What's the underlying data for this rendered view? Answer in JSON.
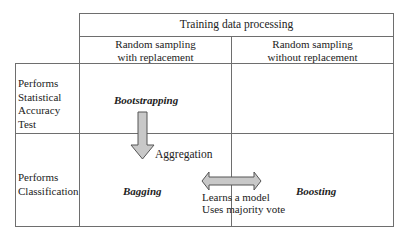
{
  "diagram": {
    "header": {
      "title": "Training data processing",
      "columns": [
        {
          "label_line1": "Random sampling",
          "label_line2": "with replacement"
        },
        {
          "label_line1": "Random sampling",
          "label_line2": "without replacement"
        }
      ]
    },
    "rows": [
      {
        "label_lines": [
          "Performs",
          "Statistical",
          "Accuracy",
          "Test"
        ]
      },
      {
        "label_lines": [
          "Performs",
          "Classification"
        ]
      }
    ],
    "cells": {
      "bootstrapping": "Bootstrapping",
      "bagging": "Bagging",
      "boosting": "Boosting"
    },
    "arrows": {
      "down_arrow": {
        "label": "Aggregation",
        "fill": "#c8c8c8",
        "stroke": "#555555"
      },
      "double_arrow": {
        "label_line1": "Learns a model",
        "label_line2": "Uses majority vote",
        "fill": "#c8c8c8",
        "stroke": "#555555"
      }
    },
    "colors": {
      "border": "#6e6e6e",
      "text": "#222222",
      "background": "#ffffff"
    }
  }
}
